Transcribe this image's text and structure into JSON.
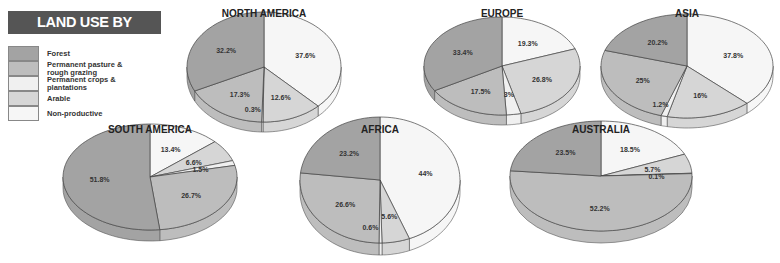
{
  "title": "LAND USE BY CONTINENT",
  "colors": {
    "forest": "#a3a3a3",
    "pasture": "#bdbdbd",
    "crops": "#f0f0f0",
    "arable": "#d6d6d6",
    "nonproductive": "#f6f6f6"
  },
  "legend": [
    {
      "key": "forest",
      "label": "Forest"
    },
    {
      "key": "pasture",
      "label": "Permanent pasture & rough grazing"
    },
    {
      "key": "crops",
      "label": "Permanent crops & plantations"
    },
    {
      "key": "arable",
      "label": "Arable"
    },
    {
      "key": "nonproductive",
      "label": "Non-productive"
    }
  ],
  "chart_data": {
    "type": "pie",
    "title": "LAND USE BY CONTINENT",
    "categories": [
      "Non-productive",
      "Arable",
      "Permanent crops & plantations",
      "Permanent pasture & rough grazing",
      "Forest"
    ],
    "legend_position": "left",
    "pies": [
      {
        "name": "NORTH AMERICA",
        "values": [
          37.6,
          12.6,
          0.3,
          17.3,
          32.2
        ]
      },
      {
        "name": "EUROPE",
        "values": [
          19.3,
          26.8,
          3,
          17.5,
          33.4
        ]
      },
      {
        "name": "ASIA",
        "values": [
          37.8,
          16,
          1.2,
          25,
          20.2
        ]
      },
      {
        "name": "SOUTH AMERICA",
        "values": [
          13.4,
          6.6,
          1.5,
          26.7,
          51.8
        ]
      },
      {
        "name": "AFRICA",
        "values": [
          44,
          5.6,
          0.6,
          26.6,
          23.2
        ]
      },
      {
        "name": "AUSTRALIA",
        "values": [
          18.5,
          5.7,
          0.1,
          52.2,
          23.5
        ]
      }
    ]
  }
}
